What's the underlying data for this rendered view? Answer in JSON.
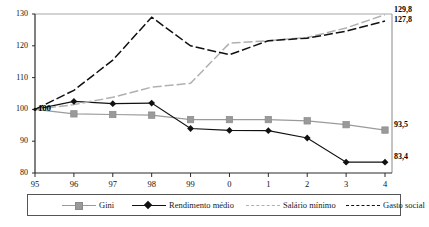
{
  "chart_data": {
    "type": "line",
    "title": "",
    "xlabel": "",
    "ylabel": "",
    "x": [
      "95",
      "96",
      "97",
      "98",
      "99",
      "0",
      "1",
      "2",
      "3",
      "4"
    ],
    "ylim": [
      80,
      130
    ],
    "xlim_index": [
      0,
      9
    ],
    "yticks": [
      80,
      90,
      100,
      110,
      120,
      130
    ],
    "grid": false,
    "legend_position": "bottom",
    "baseline_label": "100",
    "series": [
      {
        "name": "Gini",
        "color": "#9a9a9a",
        "marker": "square",
        "style": "solid",
        "values": [
          100.0,
          98.6,
          98.4,
          98.2,
          96.8,
          96.8,
          96.8,
          96.4,
          95.2,
          93.5
        ],
        "end_label": "93,5"
      },
      {
        "name": "Rendimento médio",
        "color": "#111111",
        "marker": "diamond",
        "style": "solid",
        "values": [
          100.0,
          102.5,
          101.8,
          102.0,
          94.0,
          93.4,
          93.3,
          91.0,
          83.4,
          83.4
        ],
        "end_label": "83,4"
      },
      {
        "name": "Salário mínimo",
        "color": "#b0b0b0",
        "marker": "none",
        "style": "dashed",
        "values": [
          100.0,
          101.5,
          103.8,
          107.0,
          108.2,
          120.8,
          121.6,
          122.6,
          125.6,
          129.8
        ],
        "end_label": "129,8"
      },
      {
        "name": "Gasto social",
        "color": "#111111",
        "marker": "none",
        "style": "dashed",
        "values": [
          100.0,
          106.0,
          115.5,
          129.0,
          120.0,
          117.2,
          121.6,
          122.4,
          124.6,
          127.8
        ],
        "end_label": "127,8"
      }
    ]
  },
  "legend": {
    "items": [
      {
        "label": "Gini"
      },
      {
        "label": "Rendimento médio"
      },
      {
        "label": "Salário mínimo"
      },
      {
        "label": "Gasto social"
      }
    ]
  }
}
